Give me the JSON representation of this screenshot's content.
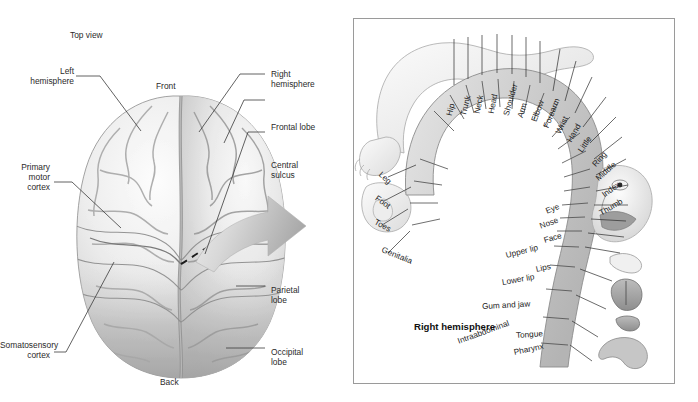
{
  "figure": {
    "title_left": "Top view",
    "left_panel": {
      "labels": [
        {
          "id": "left-hemisphere",
          "text": "Left\nhemisphere"
        },
        {
          "id": "front",
          "text": "Front"
        },
        {
          "id": "right-hemisphere",
          "text": "Right\nhemisphere"
        },
        {
          "id": "frontal-lobe",
          "text": "Frontal lobe"
        },
        {
          "id": "central-sulcus",
          "text": "Central\nsulcus"
        },
        {
          "id": "primary-motor-cortex",
          "text": "Primary\nmotor\ncortex"
        },
        {
          "id": "parietal-lobe",
          "text": "Parietal\nlobe"
        },
        {
          "id": "somatosensory-cortex",
          "text": "Somatosensory\ncortex"
        },
        {
          "id": "occipital-lobe",
          "text": "Occipital\nlobe"
        },
        {
          "id": "back",
          "text": "Back"
        }
      ]
    },
    "right_panel": {
      "caption": "Right\nhemisphere",
      "homunculus_labels": [
        {
          "id": "hip",
          "text": "Hip"
        },
        {
          "id": "trunk",
          "text": "Trunk"
        },
        {
          "id": "neck",
          "text": "Neck"
        },
        {
          "id": "head",
          "text": "Head"
        },
        {
          "id": "shoulder",
          "text": "Shoulder"
        },
        {
          "id": "arm",
          "text": "Arm"
        },
        {
          "id": "elbow",
          "text": "Elbow"
        },
        {
          "id": "forearm",
          "text": "Forearm"
        },
        {
          "id": "wrist",
          "text": "Wrist"
        },
        {
          "id": "hand",
          "text": "Hand"
        },
        {
          "id": "little",
          "text": "Little"
        },
        {
          "id": "ring",
          "text": "Ring"
        },
        {
          "id": "middle",
          "text": "Middle"
        },
        {
          "id": "index",
          "text": "Index"
        },
        {
          "id": "thumb",
          "text": "Thumb"
        },
        {
          "id": "eye",
          "text": "Eye"
        },
        {
          "id": "nose",
          "text": "Nose"
        },
        {
          "id": "face",
          "text": "Face"
        },
        {
          "id": "upper-lip",
          "text": "Upper lip"
        },
        {
          "id": "lips",
          "text": "Lips"
        },
        {
          "id": "lower-lip",
          "text": "Lower lip"
        },
        {
          "id": "gum-and-jaw",
          "text": "Gum and jaw"
        },
        {
          "id": "tongue",
          "text": "Tongue"
        },
        {
          "id": "pharynx",
          "text": "Pharynx"
        },
        {
          "id": "intraabdominal",
          "text": "Intraabdominal"
        },
        {
          "id": "leg",
          "text": "Leg"
        },
        {
          "id": "foot",
          "text": "Foot"
        },
        {
          "id": "toes",
          "text": "Toes"
        },
        {
          "id": "genitalia",
          "text": "Genitalia"
        }
      ]
    },
    "colors": {
      "ink": "#231f20",
      "panel_border": "#9a9a9a",
      "brain_light": "#f2f2f2",
      "brain_mid": "#cfcfcf",
      "brain_dark": "#9e9e9e",
      "arrow": "#c8c8c8",
      "strip": "#cfcfcf"
    }
  }
}
